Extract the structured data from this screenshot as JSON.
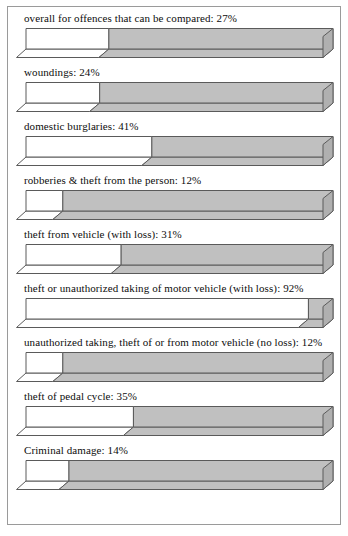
{
  "chart_data": {
    "type": "bar",
    "orientation": "horizontal",
    "title": "",
    "xlabel": "",
    "ylabel": "",
    "xlim": [
      0,
      100
    ],
    "value_unit": "%",
    "grid": false,
    "legend": false,
    "style": {
      "value_fill": "#ffffff",
      "remainder_fill": "#c0c0c0",
      "remainder_top_fill": "#d2d2d2",
      "remainder_side_fill": "#b0b0b0",
      "outline": "#5a5a5a",
      "frame": "#9a9a9a",
      "text": "#0d0d0d"
    },
    "categories": [
      "overall for offences that can be compared",
      "woundings",
      "domestic burglaries",
      "robberies & theft from the person",
      "theft from vehicle (with loss)",
      "theft or unauthorized taking of motor vehicle (with loss)",
      "unauthorized taking, theft of or from motor vehicle (no loss)",
      "theft of pedal cycle",
      "Criminal damage"
    ],
    "values": [
      27,
      24,
      41,
      12,
      31,
      92,
      12,
      35,
      14
    ],
    "labels": [
      "overall for offences that can be compared: 27%",
      "woundings: 24%",
      "domestic burglaries: 41%",
      "robberies & theft from the person: 12%",
      "theft from vehicle (with loss): 31%",
      "theft or unauthorized taking of motor vehicle (with loss): 92%",
      "unauthorized taking, theft of or from motor vehicle (no loss): 12%",
      "theft of pedal cycle: 35%",
      "Criminal damage: 14%"
    ]
  }
}
